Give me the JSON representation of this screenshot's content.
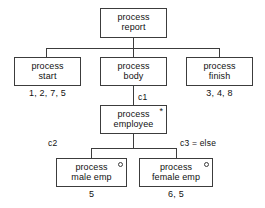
{
  "diagram": {
    "type": "structure-chart",
    "nodes": [
      {
        "id": "report",
        "line1": "process",
        "line2": "report",
        "marker": "none",
        "caption": ""
      },
      {
        "id": "start",
        "line1": "process",
        "line2": "start",
        "marker": "none",
        "caption": "1, 2, 7, 5"
      },
      {
        "id": "body",
        "line1": "process",
        "line2": "body",
        "marker": "none",
        "caption": ""
      },
      {
        "id": "finish",
        "line1": "process",
        "line2": "finish",
        "marker": "none",
        "caption": "3, 4, 8"
      },
      {
        "id": "employee",
        "line1": "process",
        "line2": "employee",
        "marker": "asterisk-icon",
        "caption": ""
      },
      {
        "id": "male",
        "line1": "process",
        "line2": "male emp",
        "marker": "circle-icon",
        "caption": "5"
      },
      {
        "id": "female",
        "line1": "process",
        "line2": "female emp",
        "marker": "circle-icon",
        "caption": "6, 5"
      }
    ],
    "edge_labels": [
      {
        "id": "c1",
        "text": "c1"
      },
      {
        "id": "c2",
        "text": "c2"
      },
      {
        "id": "c3",
        "text": "c3 = else"
      }
    ],
    "colors": {
      "border": "#3c3c3c",
      "text": "#111111",
      "background": "#ffffff"
    }
  }
}
